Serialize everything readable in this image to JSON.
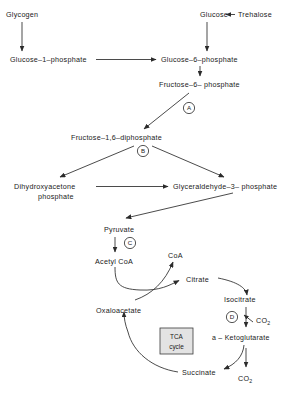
{
  "diagram": {
    "background_color": "#ffffff",
    "line_color": "#2b2b2b",
    "text_color": "#1a1a1a",
    "box_fill_color": "#e3e3e3"
  },
  "nodes": {
    "glycogen": "Glycogen",
    "glucose": "Glucose",
    "trehalose": "Trehalose",
    "glucose_1_phosphate": "Glucose–1–phosphate",
    "glucose_6_phosphate": "Glucose–6–phosphate",
    "fructose_6_phosphate": "Fructose–6– phosphate",
    "fructose_1_6_diphosphate": "Fructose–1,6–diphosphate",
    "dihydroxyacetone_line1": "Dihydroxyacetone",
    "dihydroxyacetone_line2": "phosphate",
    "glyceraldehyde_3_phosphate": "Glyceraldehyde–3– phosphate",
    "pyruvate": "Pyruvate",
    "acetyl_coa": "Acetyl CoA",
    "coa": "CoA",
    "citrate": "Citrate",
    "isocitrate": "Isocitrate",
    "alpha_ketoglutarate": "a – Ketoglutarate",
    "succinate": "Succinate",
    "oxaloacetate": "Oxaloacetate",
    "co2_upper_main": "CO",
    "co2_upper_sub": "2",
    "co2_lower_main": "CO",
    "co2_lower_sub": "2"
  },
  "tca_box": {
    "line1": "TCA",
    "line2": "cycle"
  },
  "enzyme_markers": [
    {
      "id": "enzyme-a",
      "label": "A"
    },
    {
      "id": "enzyme-b",
      "label": "B"
    },
    {
      "id": "enzyme-c",
      "label": "C"
    },
    {
      "id": "enzyme-d",
      "label": "D"
    }
  ]
}
